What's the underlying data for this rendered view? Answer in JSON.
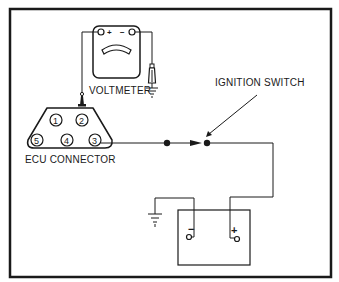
{
  "diagram": {
    "labels": {
      "voltmeter": "VOLTMETER",
      "ignition_switch": "IGNITION SWITCH",
      "ecu_connector": "ECU CONNECTOR"
    },
    "voltmeter": {
      "terminals": [
        "+",
        "−"
      ]
    },
    "ecu_connector": {
      "pins_top": [
        "1",
        "2"
      ],
      "pins_bottom": [
        "5",
        "4",
        "3"
      ]
    },
    "battery": {
      "terminals": [
        "−",
        "+"
      ]
    },
    "colors": {
      "line": "#1a1a1a",
      "background": "#ffffff"
    }
  }
}
